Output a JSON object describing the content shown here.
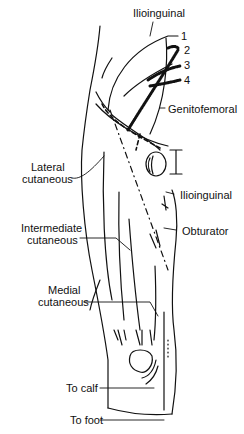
{
  "figure": {
    "stroke_color": "#111111",
    "background": "#ffffff"
  },
  "labels": {
    "ilioinguinal_top": "Ilioinguinal",
    "genitofemoral": "Genitofemoral",
    "lateral_cutaneous": [
      "Lateral",
      "cutaneous"
    ],
    "ilioinguinal_mid": "Ilioinguinal",
    "intermediate_cutaneous": [
      "Intermediate",
      "cutaneous"
    ],
    "obturator": "Obturator",
    "medial_cutaneous": [
      "Medial",
      "cutaneous"
    ],
    "to_calf": "To calf",
    "to_foot": "To foot"
  },
  "numbers": [
    "1",
    "2",
    "3",
    "4"
  ]
}
